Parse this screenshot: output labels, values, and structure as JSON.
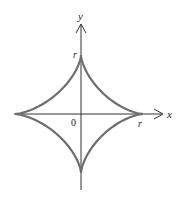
{
  "figure": {
    "type": "astroid",
    "equation_hint": "x^(2/3) + y^(2/3) = r^(2/3)",
    "labels": {
      "x_axis": "x",
      "y_axis": "y",
      "origin": "0",
      "x_intercept": "r",
      "y_intercept": "r"
    },
    "colors": {
      "curve": "#6e6e6e",
      "axes": "#333333",
      "text": "#222222"
    }
  }
}
